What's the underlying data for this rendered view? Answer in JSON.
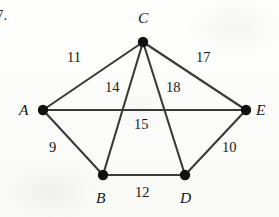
{
  "figure": {
    "problem_number": "7.",
    "background_color": "#fdfdfb",
    "ink_color": "#3a3a3a",
    "node_color": "#111111",
    "text_color": "#171717"
  },
  "chart_data": {
    "type": "diagram",
    "subtype": "weighted-undirected-graph",
    "title": "",
    "xlabel": "",
    "ylabel": "",
    "grid": false,
    "legend": false,
    "nodes": [
      {
        "id": "C",
        "label": "C",
        "x": 143,
        "y": 42,
        "label_x": 138,
        "label_y": 10,
        "radius": 5.2
      },
      {
        "id": "A",
        "label": "A",
        "x": 43,
        "y": 110,
        "label_x": 19,
        "label_y": 102,
        "radius": 5.2
      },
      {
        "id": "E",
        "label": "E",
        "x": 246,
        "y": 110,
        "label_x": 256,
        "label_y": 102,
        "radius": 5.2
      },
      {
        "id": "B",
        "label": "B",
        "x": 103,
        "y": 175,
        "label_x": 96,
        "label_y": 190,
        "radius": 5.2
      },
      {
        "id": "D",
        "label": "D",
        "x": 185,
        "y": 175,
        "label_x": 180,
        "label_y": 190,
        "radius": 5.2
      }
    ],
    "edges": [
      {
        "source": "A",
        "target": "C",
        "weight": 11,
        "label": "11",
        "label_x": 67,
        "label_y": 50
      },
      {
        "source": "C",
        "target": "E",
        "weight": 17,
        "label": "17",
        "label_x": 196,
        "label_y": 50
      },
      {
        "source": "C",
        "target": "B",
        "weight": 14,
        "label": "14",
        "label_x": 105,
        "label_y": 80
      },
      {
        "source": "C",
        "target": "D",
        "weight": 18,
        "label": "18",
        "label_x": 166,
        "label_y": 80
      },
      {
        "source": "A",
        "target": "E",
        "weight": 15,
        "label": "15",
        "label_x": 134,
        "label_y": 117
      },
      {
        "source": "A",
        "target": "B",
        "weight": 9,
        "label": "9",
        "label_x": 49,
        "label_y": 140
      },
      {
        "source": "D",
        "target": "E",
        "weight": 10,
        "label": "10",
        "label_x": 222,
        "label_y": 140
      },
      {
        "source": "B",
        "target": "D",
        "weight": 12,
        "label": "12",
        "label_x": 135,
        "label_y": 185
      }
    ]
  }
}
